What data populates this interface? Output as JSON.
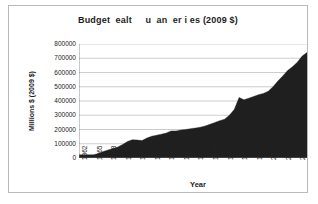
{
  "chart_data": {
    "type": "area",
    "title": "Budget  ealt     u  an  er i es (2009 $)",
    "xlabel": "Year",
    "ylabel": "Millions $ (2009 $)",
    "ylim": [
      0,
      800000
    ],
    "xlim": [
      1962,
      2009
    ],
    "grid": true,
    "legend": false,
    "y_ticks": [
      "0",
      "100000",
      "200000",
      "300000",
      "400000",
      "500000",
      "600000",
      "700000",
      "800000"
    ],
    "y_tick_values": [
      0,
      100000,
      200000,
      300000,
      400000,
      500000,
      600000,
      700000,
      800000
    ],
    "x_tick_labels": [
      "1962",
      "1965",
      "1968",
      "1971",
      "1974",
      "1977",
      "1980",
      "1983",
      "1986",
      "1989",
      "1992",
      "1995",
      "1998",
      "2001",
      "2004",
      "2007"
    ],
    "x_tick_values": [
      1962,
      1965,
      1968,
      1971,
      1974,
      1977,
      1980,
      1983,
      1986,
      1989,
      1992,
      1995,
      1998,
      2001,
      2004,
      2007
    ],
    "series_name": "Budget Health Human Services (2009 $)",
    "x": [
      1962,
      1963,
      1964,
      1965,
      1966,
      1967,
      1968,
      1969,
      1970,
      1971,
      1972,
      1973,
      1974,
      1975,
      1976,
      1977,
      1978,
      1979,
      1980,
      1981,
      1982,
      1983,
      1984,
      1985,
      1986,
      1987,
      1988,
      1989,
      1990,
      1991,
      1992,
      1993,
      1994,
      1995,
      1996,
      1997,
      1998,
      1999,
      2000,
      2001,
      2002,
      2003,
      2004,
      2005,
      2006,
      2007,
      2008,
      2009
    ],
    "values": [
      22000,
      22000,
      22000,
      23000,
      31000,
      45000,
      57000,
      66000,
      77000,
      95000,
      116000,
      128000,
      126000,
      122000,
      140000,
      153000,
      160000,
      167000,
      175000,
      190000,
      190000,
      196000,
      200000,
      206000,
      210000,
      216000,
      225000,
      236000,
      249000,
      262000,
      272000,
      300000,
      340000,
      425000,
      408000,
      420000,
      432000,
      444000,
      453000,
      468000,
      500000,
      540000,
      575000,
      614000,
      640000,
      672000,
      715000,
      740000
    ],
    "fill_color": "#1f1f1f",
    "grid_color": "#9a9a9a",
    "axis_color": "#7a7a7a"
  },
  "frame": {
    "border_color": "#b9b9b9",
    "background": "#ffffff"
  }
}
